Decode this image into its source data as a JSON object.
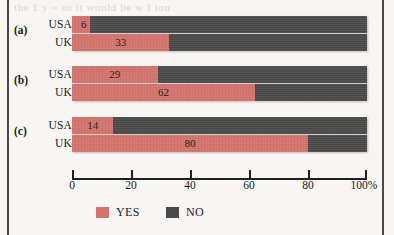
{
  "chart_data": {
    "type": "bar",
    "subtype": "horizontal-100-percent-stacked",
    "title": "",
    "xlabel": "",
    "ylabel": "",
    "xlim": [
      0,
      100
    ],
    "xticks": [
      0,
      20,
      40,
      60,
      80,
      100
    ],
    "xticklabels": [
      "0",
      "20",
      "40",
      "60",
      "80",
      "100%"
    ],
    "grid": false,
    "legend": {
      "position": "bottom",
      "entries": [
        {
          "name": "YES",
          "color": "#d4736d"
        },
        {
          "name": "NO",
          "color": "#4a4a4a"
        }
      ]
    },
    "groups": [
      {
        "tag": "(a)",
        "rows": [
          {
            "label": "USA",
            "yes": 6,
            "no": 94,
            "value_text": "6"
          },
          {
            "label": "UK",
            "yes": 33,
            "no": 67,
            "value_text": "33"
          }
        ]
      },
      {
        "tag": "(b)",
        "rows": [
          {
            "label": "USA",
            "yes": 29,
            "no": 71,
            "value_text": "29"
          },
          {
            "label": "UK",
            "yes": 62,
            "no": 38,
            "value_text": "62"
          }
        ]
      },
      {
        "tag": "(c)",
        "rows": [
          {
            "label": "USA",
            "yes": 14,
            "no": 86,
            "value_text": "14"
          },
          {
            "label": "UK",
            "yes": 80,
            "no": 20,
            "value_text": "80"
          }
        ]
      }
    ],
    "series": [
      {
        "name": "YES",
        "values": [
          6,
          33,
          29,
          62,
          14,
          80
        ]
      },
      {
        "name": "NO",
        "values": [
          94,
          67,
          71,
          38,
          86,
          20
        ]
      }
    ],
    "categories": [
      "(a) USA",
      "(a) UK",
      "(b) USA",
      "(b) UK",
      "(c) USA",
      "(c) UK"
    ]
  },
  "colors": {
    "yes": "#d4736d",
    "no": "#4a4a4a",
    "paper": "#f7f6f3",
    "ink": "#1a1a1a"
  },
  "artifacts": {
    "bleed_top": "the  1 y   ~ so  it would be   w I ion",
    "bleed_bottom": ""
  }
}
